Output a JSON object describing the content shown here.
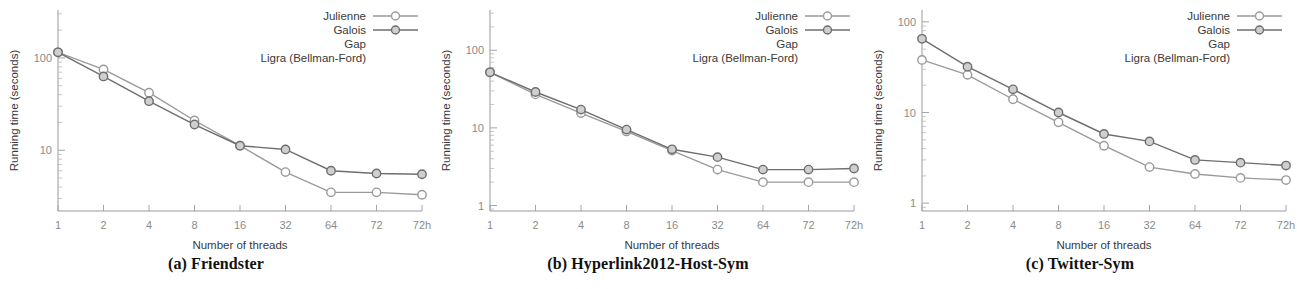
{
  "figure": {
    "axis_titles": {
      "x": "Number of threads",
      "y": "Running time (seconds)"
    },
    "legend": {
      "entries": [
        {
          "label": "Julienne",
          "color": "#9a9a9a",
          "has_marker": true
        },
        {
          "label": "Galois",
          "color": "#6e6e6e",
          "has_marker": true
        },
        {
          "label": "Gap",
          "color": "#8a8a8a",
          "has_marker": false
        },
        {
          "label": "Ligra (Bellman-Ford)",
          "color": "#8a8a8a",
          "has_marker": false
        }
      ]
    },
    "captions": [
      "(a) Friendster",
      "(b) Hyperlink2012-Host-Sym",
      "(c) Twitter-Sym"
    ]
  },
  "chart_data": [
    {
      "type": "line",
      "title": "(a) Friendster",
      "xlabel": "Number of threads",
      "ylabel": "Running time (seconds)",
      "xscale": "log2",
      "yscale": "log10",
      "categories": [
        "1",
        "2",
        "4",
        "8",
        "16",
        "32",
        "64",
        "72",
        "72h"
      ],
      "ytick_labels": [
        "100",
        "10"
      ],
      "ytick_values": [
        100,
        10
      ],
      "ylim": [
        2.2,
        330
      ],
      "grid": false,
      "legend_position": "top-right",
      "series": [
        {
          "name": "Julienne",
          "color": "#9a9a9a",
          "values": [
            115,
            75,
            42,
            21,
            11.2,
            5.8,
            3.5,
            3.5,
            3.3
          ]
        },
        {
          "name": "Galois",
          "color": "#6e6e6e",
          "values": [
            115,
            63,
            34,
            19,
            11.2,
            10.2,
            6.0,
            5.6,
            5.5
          ]
        }
      ]
    },
    {
      "type": "line",
      "title": "(b) Hyperlink2012-Host-Sym",
      "xlabel": "Number of threads",
      "ylabel": "Running time (seconds)",
      "xscale": "log2",
      "yscale": "log10",
      "categories": [
        "1",
        "2",
        "4",
        "8",
        "16",
        "32",
        "64",
        "72",
        "72h"
      ],
      "ytick_labels": [
        "100",
        "10",
        "1"
      ],
      "ytick_values": [
        100,
        10,
        1
      ],
      "ylim": [
        0.85,
        330
      ],
      "grid": false,
      "legend_position": "top-right",
      "series": [
        {
          "name": "Julienne",
          "color": "#9a9a9a",
          "values": [
            52,
            27,
            15.5,
            9.0,
            5.1,
            2.9,
            2.0,
            2.0,
            2.0
          ]
        },
        {
          "name": "Galois",
          "color": "#6e6e6e",
          "values": [
            52,
            29,
            17.2,
            9.5,
            5.3,
            4.2,
            2.9,
            2.9,
            3.0
          ]
        }
      ]
    },
    {
      "type": "line",
      "title": "(c) Twitter-Sym",
      "xlabel": "Number of threads",
      "ylabel": "Running time (seconds)",
      "xscale": "log2",
      "yscale": "log10",
      "categories": [
        "1",
        "2",
        "4",
        "8",
        "16",
        "32",
        "64",
        "72",
        "72h"
      ],
      "ytick_labels": [
        "100",
        "10",
        "1"
      ],
      "ytick_values": [
        100,
        10,
        1
      ],
      "ylim": [
        0.82,
        135
      ],
      "grid": false,
      "legend_position": "top-right",
      "series": [
        {
          "name": "Julienne",
          "color": "#9a9a9a",
          "values": [
            38,
            26,
            14.0,
            7.8,
            4.3,
            2.5,
            2.1,
            1.9,
            1.8
          ]
        },
        {
          "name": "Galois",
          "color": "#6e6e6e",
          "values": [
            65,
            32,
            18.0,
            10.0,
            5.8,
            4.8,
            3.0,
            2.8,
            2.6
          ]
        }
      ]
    }
  ]
}
